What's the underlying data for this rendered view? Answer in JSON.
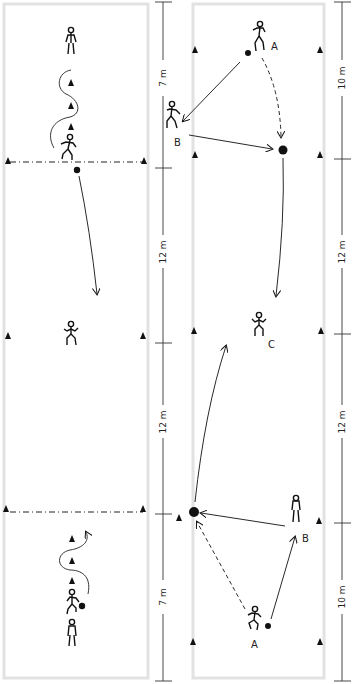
{
  "diagram": {
    "type": "soccer drill diagram",
    "panels": [
      {
        "id": "left",
        "description": "Dribbling slalom drill through cones with long pass to centre player",
        "scale": [
          {
            "label": "7 m"
          },
          {
            "label": "12 m"
          },
          {
            "label": "12 m"
          },
          {
            "label": "7 m"
          }
        ]
      },
      {
        "id": "right",
        "description": "Passing combination A-B with run to ball, long pass to C",
        "player_labels": {
          "a_top": "A",
          "b_top": "B",
          "c_mid": "C",
          "b_bottom": "B",
          "a_bottom": "A"
        },
        "scale": [
          {
            "label": "10 m"
          },
          {
            "label": "12 m"
          },
          {
            "label": "12 m"
          },
          {
            "label": "10 m"
          }
        ]
      }
    ],
    "colors": {
      "field_border": "#e2e2e2",
      "ink": "#111111",
      "scale_line": "#333333"
    }
  }
}
